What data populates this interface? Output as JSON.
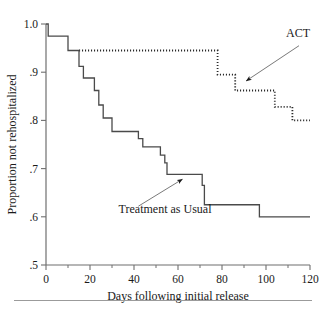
{
  "figure": {
    "name": "kaplan-meier-rehospitalization",
    "bottom_rule": true
  },
  "chart_data": {
    "type": "line",
    "title": "",
    "xlabel": "Days following initial release",
    "ylabel": "Proportion not rehospitalized",
    "xlim": [
      0,
      120
    ],
    "ylim": [
      0.5,
      1.0
    ],
    "xticks": [
      0,
      20,
      40,
      60,
      80,
      100,
      120
    ],
    "xticklabels": [
      "0",
      "20",
      "40",
      "60",
      "80",
      "100",
      "120"
    ],
    "xminorticks": [
      10,
      30,
      50,
      70,
      90,
      110
    ],
    "yticks": [
      0.5,
      0.6,
      0.7,
      0.8,
      0.9,
      1.0
    ],
    "yticklabels": [
      ".5",
      ".6",
      ".7",
      ".8",
      ".9",
      "1.0"
    ],
    "grid": false,
    "legend_position": "annotations",
    "step_style": "post",
    "series": [
      {
        "name": "ACT",
        "style": "dotted",
        "color": "#2a2a2a",
        "x": [
          15,
          78,
          78,
          86,
          86,
          104,
          104,
          112,
          112,
          120
        ],
        "y": [
          0.945,
          0.945,
          0.895,
          0.895,
          0.862,
          0.862,
          0.828,
          0.828,
          0.8,
          0.8
        ]
      },
      {
        "name": "Treatment as Usual",
        "style": "solid",
        "color": "#4a4a4a",
        "x": [
          0,
          1,
          1,
          10,
          10,
          15,
          15,
          17,
          17,
          22,
          22,
          24,
          24,
          26,
          26,
          30,
          30,
          42,
          42,
          44,
          44,
          52,
          52,
          54,
          54,
          55,
          55,
          69,
          69,
          71,
          71,
          72,
          72,
          97,
          97,
          120
        ],
        "y": [
          1.0,
          1.0,
          0.975,
          0.975,
          0.945,
          0.945,
          0.912,
          0.912,
          0.888,
          0.888,
          0.862,
          0.862,
          0.832,
          0.832,
          0.805,
          0.805,
          0.777,
          0.777,
          0.762,
          0.762,
          0.745,
          0.745,
          0.728,
          0.728,
          0.712,
          0.712,
          0.688,
          0.688,
          0.688,
          0.688,
          0.665,
          0.665,
          0.625,
          0.625,
          0.6,
          0.6
        ]
      }
    ],
    "annotations": [
      {
        "name": "act-annotation",
        "text": "ACT",
        "text_x": 120,
        "text_y": 0.972,
        "arrow_from_x": 115,
        "arrow_from_y": 0.955,
        "arrow_to_x": 91,
        "arrow_to_y": 0.882
      },
      {
        "name": "treatment-as-usual-annotation",
        "text": "Treatment as Usual",
        "text_x": 33,
        "text_y": 0.608,
        "arrow_from_x": 42,
        "arrow_from_y": 0.622,
        "arrow_to_x": 62,
        "arrow_to_y": 0.678
      }
    ]
  }
}
